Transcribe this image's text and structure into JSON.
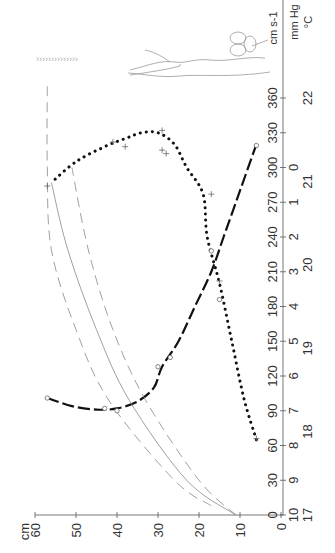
{
  "chart_data": {
    "type": "line",
    "orientation": "rotated 90deg counter-clockwise (time axis vertical on right, length axis horizontal at bottom)",
    "title": "",
    "xlabel": "time (min)",
    "ylabel": "cm",
    "xlim": [
      0,
      360
    ],
    "ylim": [
      0,
      60
    ],
    "x_ticks": [
      0,
      30,
      60,
      90,
      120,
      150,
      180,
      210,
      240,
      270,
      300,
      330,
      360
    ],
    "y_ticks": [
      0,
      10,
      20,
      30,
      40,
      50,
      60
    ],
    "y_unit_label": "cm",
    "secondary_axes": [
      {
        "unit": "cm s-1",
        "ticks": [],
        "note": "velocity scale label"
      },
      {
        "unit": "mm Hg",
        "ticks": [
          10,
          9,
          8,
          7,
          6,
          5,
          4,
          3,
          2,
          1,
          0
        ],
        "tick_positions_min": [
          0,
          30,
          60,
          90,
          120,
          150,
          180,
          210,
          240,
          270,
          300
        ]
      },
      {
        "unit": "°C",
        "ticks": [
          17,
          18,
          19,
          20,
          21,
          22
        ],
        "tick_positions_min": [
          0,
          72,
          144,
          216,
          288,
          360
        ]
      }
    ],
    "grid": false,
    "legend": null,
    "series": [
      {
        "name": "dotted curve (+ markers)",
        "style": "dotted thick",
        "points": [
          [
            65,
            6
          ],
          [
            100,
            9
          ],
          [
            150,
            12
          ],
          [
            200,
            15
          ],
          [
            240,
            18
          ],
          [
            277,
            19
          ],
          [
            300,
            23
          ],
          [
            320,
            26
          ],
          [
            330,
            30
          ],
          [
            330,
            34
          ],
          [
            325,
            38
          ],
          [
            318,
            43
          ],
          [
            305,
            50
          ],
          [
            287,
            56
          ]
        ],
        "markers": [
          [
            66,
            6
          ],
          [
            202,
            15
          ],
          [
            277,
            17
          ],
          [
            312,
            28
          ],
          [
            315,
            29
          ],
          [
            332,
            29
          ],
          [
            318,
            38
          ],
          [
            322,
            41
          ],
          [
            284,
            57
          ]
        ]
      },
      {
        "name": "dashed curve (o markers)",
        "style": "long-dash thick",
        "points": [
          [
            101,
            57
          ],
          [
            94,
            51
          ],
          [
            91,
            45
          ],
          [
            92,
            40
          ],
          [
            98,
            35
          ],
          [
            110,
            31
          ],
          [
            128,
            29
          ],
          [
            150,
            25
          ],
          [
            180,
            21
          ],
          [
            210,
            17
          ],
          [
            240,
            14
          ],
          [
            280,
            10
          ],
          [
            320,
            6
          ]
        ],
        "markers": [
          [
            101,
            57
          ],
          [
            92,
            43
          ],
          [
            90,
            40
          ],
          [
            128,
            30
          ],
          [
            136,
            27
          ],
          [
            186,
            15
          ],
          [
            228,
            17
          ],
          [
            319,
            6
          ]
        ]
      },
      {
        "name": "thin dashed outer",
        "style": "thin dashed",
        "points": [
          [
            8,
            17
          ],
          [
            30,
            26
          ],
          [
            99,
            42
          ],
          [
            160,
            50
          ],
          [
            229,
            56
          ],
          [
            300,
            57
          ],
          [
            370,
            57
          ]
        ]
      },
      {
        "name": "thin solid middle",
        "style": "thin solid",
        "points": [
          [
            0,
            11
          ],
          [
            30,
            23
          ],
          [
            99,
            37
          ],
          [
            160,
            45
          ],
          [
            229,
            52
          ],
          [
            287,
            56
          ]
        ]
      },
      {
        "name": "thin dashed inner",
        "style": "thin dashed",
        "points": [
          [
            0,
            11
          ],
          [
            30,
            20
          ],
          [
            99,
            33
          ],
          [
            160,
            41
          ],
          [
            229,
            47
          ],
          [
            300,
            51
          ]
        ]
      }
    ],
    "annotations": [
      "plant seedling illustration near top",
      "small arrowhead row (leaf/wind glyphs) near top-left"
    ]
  },
  "axes": {
    "x_tick_labels": [
      "0",
      "30",
      "60",
      "90",
      "120",
      "150",
      "180",
      "210",
      "240",
      "270",
      "300",
      "330",
      "360"
    ],
    "y_tick_labels": [
      "0",
      "10",
      "20",
      "30",
      "40",
      "50",
      "60"
    ],
    "y_unit": "cm",
    "pressure_labels": [
      "10",
      "9",
      "8",
      "7",
      "6",
      "5",
      "4",
      "3",
      "2",
      "1",
      "0"
    ],
    "temp_labels": [
      "17",
      "18",
      "19",
      "20",
      "21",
      "22"
    ],
    "unit_velocity": "cm s-1",
    "unit_pressure": "mm Hg",
    "unit_temp": "°C"
  }
}
